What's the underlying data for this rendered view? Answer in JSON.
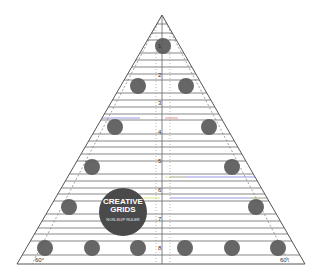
{
  "product": {
    "brand": "CREATIVE GRIDS",
    "brand_line1": "CREATIVE",
    "brand_line2": "GRIDS",
    "subtitle": "NON-SLIP RULER",
    "small_text_top": "EST. 1997",
    "small_text_bottom": "Made in the UK"
  },
  "scale": {
    "numbers": [
      "1",
      "2",
      "3",
      "4",
      "5",
      "6",
      "7",
      "8"
    ]
  },
  "angles": {
    "left": "60°",
    "right": "60°"
  },
  "colors": {
    "grip_dot": "#5a5a5a",
    "line": "#555555",
    "accent_blue": "#6a6adf",
    "accent_yellow": "#d8e85a",
    "accent_red": "#d86a5a"
  }
}
